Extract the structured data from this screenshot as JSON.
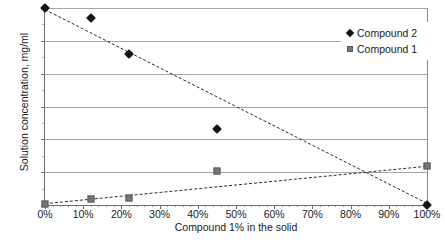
{
  "chart_data": {
    "type": "scatter",
    "title": "",
    "xlabel": "Compound 1% in the solid",
    "ylabel": "Solution concentration, mg/ml",
    "xlim": [
      0,
      100
    ],
    "ylim": [
      0,
      6
    ],
    "xticks": [
      "0%",
      "10%",
      "20%",
      "30%",
      "40%",
      "50%",
      "60%",
      "70%",
      "80%",
      "90%",
      "100%"
    ],
    "xtick_values": [
      0,
      10,
      20,
      30,
      40,
      50,
      60,
      70,
      80,
      90,
      100
    ],
    "yticks": [
      "0",
      "1",
      "2",
      "3",
      "4",
      "5",
      "6"
    ],
    "ytick_values": [
      0,
      1,
      2,
      3,
      4,
      5,
      6
    ],
    "grid": "horizontal",
    "legend_position": "top-right-inside",
    "series": [
      {
        "name": "Compound 2",
        "marker": "diamond",
        "color": "#151515",
        "x": [
          0,
          12,
          22,
          45,
          100
        ],
        "y": [
          6.0,
          5.7,
          4.6,
          2.3,
          0.0
        ],
        "trendline": {
          "style": "dashed",
          "x": [
            0,
            100
          ],
          "y": [
            5.95,
            0.05
          ]
        }
      },
      {
        "name": "Compound 1",
        "marker": "square",
        "color": "#767676",
        "x": [
          0,
          12,
          22,
          45,
          100
        ],
        "y": [
          0.03,
          0.18,
          0.2,
          1.05,
          1.2
        ],
        "trendline": {
          "style": "dashed",
          "x": [
            0,
            100
          ],
          "y": [
            0.04,
            1.18
          ]
        }
      }
    ],
    "annotations": [
      "Trendlines intersect near 85%, 1.0 mg/ml"
    ]
  },
  "legend": {
    "entries": [
      {
        "label": "Compound 2",
        "marker": "diamond-marker-icon"
      },
      {
        "label": "Compound 1",
        "marker": "square-marker-icon"
      }
    ]
  }
}
